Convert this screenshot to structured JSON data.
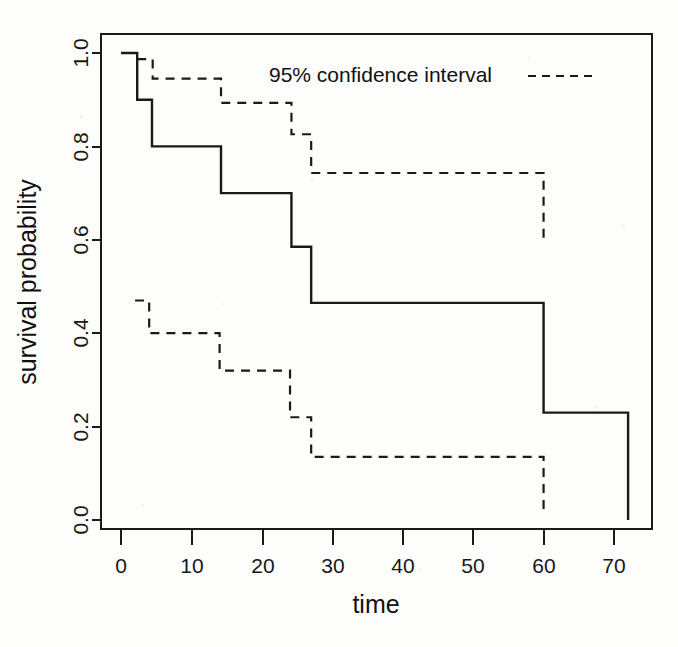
{
  "chart_data": {
    "type": "line",
    "title": "",
    "xlabel": "time",
    "ylabel": "survival probability",
    "xlim": [
      -2,
      76
    ],
    "ylim": [
      0.0,
      1.05
    ],
    "grid": false,
    "xticks": [
      0,
      10,
      20,
      30,
      40,
      50,
      60,
      70
    ],
    "xtick_labels": [
      "0",
      "10",
      "20",
      "30",
      "40",
      "50",
      "60",
      "70"
    ],
    "yticks": [
      0.0,
      0.2,
      0.4,
      0.6,
      0.8,
      1.0
    ],
    "ytick_labels": [
      "0.0",
      "0.2",
      "0.4",
      "0.6",
      "0.8",
      "1.0"
    ],
    "legend": {
      "position": "top-center-right",
      "entries": [
        {
          "label": "95% confidence interval",
          "style": "dashed"
        }
      ]
    },
    "series": [
      {
        "name": "Kaplan-Meier survival estimate",
        "style": "solid",
        "color": "#1a1a1a",
        "step": "post",
        "x": [
          0,
          2.3,
          4.4,
          14.2,
          24.2,
          27.0,
          60.0,
          72.0,
          72.0
        ],
        "y": [
          1.0,
          0.9,
          0.8,
          0.7,
          0.585,
          0.465,
          0.23,
          0.23,
          0.0
        ]
      },
      {
        "name": "95% CI upper",
        "style": "dashed",
        "color": "#1a1a1a",
        "step": "post",
        "x": [
          2.3,
          4.5,
          14.2,
          24.2,
          27.0,
          60.0,
          60.0
        ],
        "y": [
          0.987,
          0.945,
          0.893,
          0.826,
          0.743,
          0.743,
          0.6
        ]
      },
      {
        "name": "95% CI lower",
        "style": "dashed",
        "color": "#1a1a1a",
        "step": "post",
        "x": [
          2.0,
          4.0,
          14.0,
          24.0,
          27.0,
          60.0,
          60.0
        ],
        "y": [
          0.47,
          0.4,
          0.32,
          0.22,
          0.135,
          0.135,
          0.02
        ]
      }
    ]
  },
  "axes": {
    "x_title": "time",
    "y_title": "survival probability"
  },
  "legend_label": "95% confidence interval"
}
